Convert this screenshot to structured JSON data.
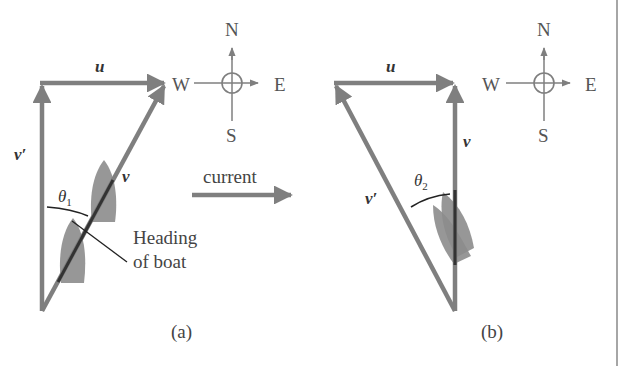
{
  "colors": {
    "vector": "#7f7f7f",
    "boat": "#8c8c8c",
    "line": "#222222",
    "text": "#444444",
    "border": "#888888"
  },
  "panel_a": {
    "caption": "(a)",
    "vectors": {
      "u": "u",
      "v": "v",
      "v_prime": "v′"
    },
    "angle": {
      "symbol": "θ",
      "subscript": "1"
    },
    "heading_label": {
      "line1": "Heading",
      "line2": "of boat"
    },
    "compass": {
      "north": "N",
      "south": "S",
      "east": "E",
      "west": "W"
    }
  },
  "current": {
    "label": "current"
  },
  "panel_b": {
    "caption": "(b)",
    "vectors": {
      "u": "u",
      "v": "v",
      "v_prime": "v′"
    },
    "angle": {
      "symbol": "θ",
      "subscript": "2"
    },
    "compass": {
      "north": "N",
      "south": "S",
      "east": "E",
      "west": "W"
    }
  }
}
